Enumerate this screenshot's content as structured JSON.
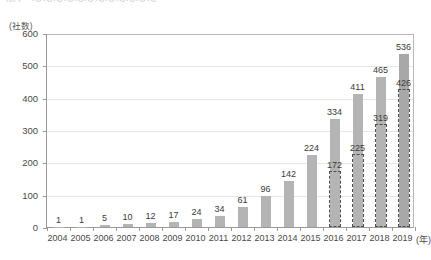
{
  "figure": {
    "title_fragment": "図1　～～～～～～～～～～～～",
    "y_unit_label": "(社数)",
    "x_unit_label": "(年)"
  },
  "chart_data": {
    "type": "bar",
    "title": "",
    "xlabel": "(年)",
    "ylabel": "(社数)",
    "ylim": [
      0,
      600
    ],
    "ytick_step": 100,
    "yticks": [
      "0",
      "100",
      "200",
      "300",
      "400",
      "500",
      "600"
    ],
    "grid": true,
    "legend": "none",
    "categories": [
      "2004",
      "2005",
      "2006",
      "2007",
      "2008",
      "2009",
      "2010",
      "2011",
      "2012",
      "2013",
      "2014",
      "2015",
      "2016",
      "2017",
      "2018",
      "2019"
    ],
    "series": [
      {
        "name": "total",
        "style": "solid-fill",
        "color": "#b4b4b4",
        "values": [
          1,
          1,
          5,
          10,
          12,
          17,
          24,
          34,
          61,
          96,
          142,
          224,
          334,
          411,
          465,
          536
        ]
      },
      {
        "name": "subset",
        "style": "dashed-outline",
        "color": "#4d4d4d",
        "values": [
          null,
          null,
          null,
          null,
          null,
          null,
          null,
          null,
          null,
          null,
          null,
          null,
          172,
          225,
          319,
          426
        ]
      }
    ],
    "data_labels": {
      "total": [
        "1",
        "1",
        "5",
        "10",
        "12",
        "17",
        "24",
        "34",
        "61",
        "96",
        "142",
        "224",
        "334",
        "411",
        "465",
        "536"
      ],
      "subset": [
        "",
        "",
        "",
        "",
        "",
        "",
        "",
        "",
        "",
        "",
        "",
        "",
        "172",
        "225",
        "319",
        "426"
      ]
    }
  }
}
